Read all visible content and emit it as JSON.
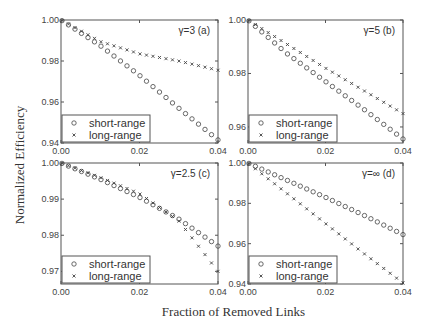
{
  "chart_data": [
    {
      "type": "scatter",
      "panel": "(a)",
      "annotation": "γ=3   (a)",
      "x_range": [
        0.0,
        0.04
      ],
      "ylim": [
        0.94,
        1.0
      ],
      "x_ticks": [
        "0.00",
        "0.02",
        "0.04"
      ],
      "y_ticks": [
        "0.94",
        "0.96",
        "0.98",
        "1.00"
      ],
      "y_tick_values": [
        0.94,
        0.96,
        0.98,
        1.0
      ],
      "anchor_x": [
        0.0,
        0.01,
        0.02,
        0.03,
        0.04
      ],
      "series": [
        {
          "name": "short-range",
          "marker": "circle",
          "values": [
            1.0,
            0.9875,
            0.973,
            0.957,
            0.9415
          ]
        },
        {
          "name": "long-range",
          "marker": "x",
          "values": [
            1.0,
            0.9895,
            0.9835,
            0.98,
            0.9755
          ]
        }
      ],
      "legend_position": "lower left"
    },
    {
      "type": "scatter",
      "panel": "(b)",
      "annotation": "γ=5   (b)",
      "x_range": [
        0.0,
        0.04
      ],
      "ylim": [
        0.954,
        1.0
      ],
      "x_ticks": [
        "0.00",
        "0.02",
        "0.04"
      ],
      "y_ticks": [
        "0.96",
        "0.98",
        "1.00"
      ],
      "y_tick_values": [
        0.96,
        0.98,
        1.0
      ],
      "anchor_x": [
        0.0,
        0.01,
        0.02,
        0.03,
        0.04
      ],
      "series": [
        {
          "name": "short-range",
          "marker": "circle",
          "values": [
            1.0,
            0.9875,
            0.977,
            0.9665,
            0.9555
          ]
        },
        {
          "name": "long-range",
          "marker": "x",
          "values": [
            1.0,
            0.991,
            0.982,
            0.9735,
            0.965
          ]
        }
      ],
      "legend_position": "lower left"
    },
    {
      "type": "scatter",
      "panel": "(c)",
      "annotation": "γ=2.5   (c)",
      "x_range": [
        0.0,
        0.04
      ],
      "ylim": [
        0.9665,
        1.0
      ],
      "x_ticks": [
        "0.00",
        "0.02",
        "0.04"
      ],
      "y_ticks": [
        "0.97",
        "0.98",
        "0.99",
        "1.00"
      ],
      "y_tick_values": [
        0.97,
        0.98,
        0.99,
        1.0
      ],
      "anchor_x": [
        0.0,
        0.01,
        0.02,
        0.03,
        0.04
      ],
      "series": [
        {
          "name": "short-range",
          "marker": "circle",
          "values": [
            1.0,
            0.9955,
            0.9905,
            0.9845,
            0.977
          ]
        },
        {
          "name": "long-range",
          "marker": "x",
          "values": [
            1.0,
            0.996,
            0.9915,
            0.984,
            0.97
          ]
        }
      ],
      "legend_position": "lower left"
    },
    {
      "type": "scatter",
      "panel": "(d)",
      "annotation": "γ=∞   (d)",
      "x_range": [
        0.0,
        0.04
      ],
      "ylim": [
        0.94,
        1.0
      ],
      "x_ticks": [
        "0.00",
        "0.02",
        "0.04"
      ],
      "y_ticks": [
        "0.94",
        "0.96",
        "0.98",
        "1.00"
      ],
      "y_tick_values": [
        0.94,
        0.96,
        0.98,
        1.0
      ],
      "anchor_x": [
        0.0,
        0.01,
        0.02,
        0.03,
        0.04
      ],
      "series": [
        {
          "name": "short-range",
          "marker": "circle",
          "values": [
            1.0,
            0.9915,
            0.983,
            0.974,
            0.9645
          ]
        },
        {
          "name": "long-range",
          "marker": "x",
          "values": [
            1.0,
            0.985,
            0.97,
            0.955,
            0.9405
          ]
        }
      ],
      "legend_position": "lower left"
    }
  ],
  "xlabel": "Fraction of Removed Links",
  "ylabel": "Normalized Efficiency",
  "legend": {
    "short": "short-range",
    "long": "long-range"
  },
  "colors": {
    "axis": "#555555",
    "marker": "#444444",
    "text": "#333333"
  }
}
